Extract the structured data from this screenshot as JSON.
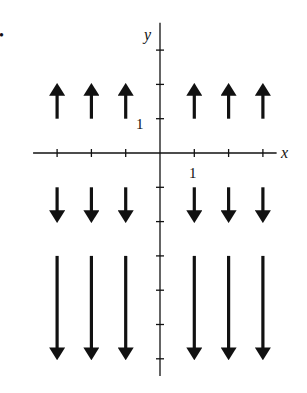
{
  "figure": {
    "marker": "•",
    "axes": {
      "x_label": "x",
      "y_label": "y",
      "x_tick_label": "1",
      "y_tick_label": "1",
      "x_ticks": [
        -3,
        -2,
        -1,
        1,
        2,
        3
      ],
      "y_ticks": [
        3,
        2,
        1,
        -1,
        -2,
        -3,
        -4,
        -5,
        -6
      ],
      "x_range": [
        -3.7,
        3.4
      ],
      "y_range": [
        -6.5,
        3.8
      ]
    },
    "colors": {
      "ink": "#111111",
      "background": "#ffffff"
    }
  },
  "chart_data": {
    "type": "vector_field",
    "title": "",
    "xlabel": "x",
    "ylabel": "y",
    "field": "F(x, y) = (0, y)",
    "vectors": [
      {
        "x": -3,
        "y": 1,
        "dx": 0,
        "dy": 1
      },
      {
        "x": -2,
        "y": 1,
        "dx": 0,
        "dy": 1
      },
      {
        "x": -1,
        "y": 1,
        "dx": 0,
        "dy": 1
      },
      {
        "x": 1,
        "y": 1,
        "dx": 0,
        "dy": 1
      },
      {
        "x": 2,
        "y": 1,
        "dx": 0,
        "dy": 1
      },
      {
        "x": 3,
        "y": 1,
        "dx": 0,
        "dy": 1
      },
      {
        "x": -3,
        "y": -1,
        "dx": 0,
        "dy": -1
      },
      {
        "x": -2,
        "y": -1,
        "dx": 0,
        "dy": -1
      },
      {
        "x": -1,
        "y": -1,
        "dx": 0,
        "dy": -1
      },
      {
        "x": 1,
        "y": -1,
        "dx": 0,
        "dy": -1
      },
      {
        "x": 2,
        "y": -1,
        "dx": 0,
        "dy": -1
      },
      {
        "x": 3,
        "y": -1,
        "dx": 0,
        "dy": -1
      },
      {
        "x": -3,
        "y": -3,
        "dx": 0,
        "dy": -3
      },
      {
        "x": -2,
        "y": -3,
        "dx": 0,
        "dy": -3
      },
      {
        "x": -1,
        "y": -3,
        "dx": 0,
        "dy": -3
      },
      {
        "x": 1,
        "y": -3,
        "dx": 0,
        "dy": -3
      },
      {
        "x": 2,
        "y": -3,
        "dx": 0,
        "dy": -3
      },
      {
        "x": 3,
        "y": -3,
        "dx": 0,
        "dy": -3
      }
    ],
    "x_ticks": [
      -3,
      -2,
      -1,
      1,
      2,
      3
    ],
    "y_ticks": [
      3,
      2,
      1,
      -1,
      -2,
      -3,
      -4,
      -5,
      -6
    ],
    "grid": false
  }
}
